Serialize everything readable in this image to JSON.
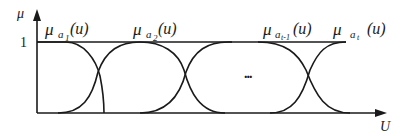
{
  "diagram": {
    "type": "fuzzy-membership-functions",
    "y_axis": {
      "label": "μ",
      "tick_label": "1"
    },
    "x_axis": {
      "label": "U"
    },
    "ellipsis": "...",
    "functions": [
      {
        "mu": "μ",
        "sub": "a",
        "sub_index": "1",
        "arg": "(u)"
      },
      {
        "mu": "μ",
        "sub": "a",
        "sub_index": "2",
        "arg": "(u)"
      },
      {
        "mu": "μ",
        "sub": "a",
        "sub_index": "t-1",
        "arg": "(u)"
      },
      {
        "mu": "μ",
        "sub": "a",
        "sub_index": "t",
        "arg": "(u)"
      }
    ],
    "colors": {
      "line": "#1a1a1a",
      "background": "#ffffff"
    }
  }
}
